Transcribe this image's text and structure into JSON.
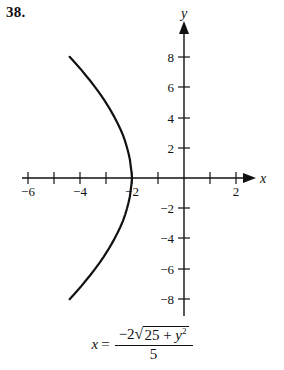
{
  "problem": {
    "number": "38."
  },
  "chart_data": {
    "type": "line",
    "title": "",
    "xlabel": "x",
    "ylabel": "y",
    "grid": false,
    "legend": null,
    "xlim": [
      -6.8,
      2.9
    ],
    "ylim": [
      -9.0,
      9.0
    ],
    "xticks": [
      -6,
      -5,
      -4,
      -3,
      -2,
      -1,
      1,
      2
    ],
    "yticks": [
      -8,
      -6,
      -4,
      -2,
      2,
      4,
      6,
      8
    ],
    "xtick_labels": [
      "−6",
      "−4",
      "−2",
      "2"
    ],
    "xtick_label_values": [
      -6,
      -4,
      -2,
      2
    ],
    "ytick_labels": [
      "8",
      "6",
      "4",
      "2",
      "−2",
      "−4",
      "−6",
      "−8"
    ],
    "ytick_label_values": [
      8,
      6,
      4,
      2,
      -2,
      -4,
      -6,
      -8
    ],
    "equation": "x = -2*sqrt(25 + y^2)/5",
    "curve_description": "left branch of a hyperbola opening leftward, vertex at (-2, 0)",
    "vertex": [
      -2,
      0
    ],
    "series": [
      {
        "name": "x = -2√(25 + y²)/5",
        "x": [
          -4.4,
          -4.19,
          -3.98,
          -3.79,
          -3.6,
          -3.42,
          -3.25,
          -3.09,
          -2.94,
          -2.8,
          -2.67,
          -2.55,
          -2.44,
          -2.34,
          -2.26,
          -2.19,
          -2.13,
          -2.08,
          -2.05,
          -2.02,
          -2.0,
          -2.02,
          -2.05,
          -2.08,
          -2.13,
          -2.19,
          -2.26,
          -2.34,
          -2.44,
          -2.55,
          -2.67,
          -2.8,
          -2.94,
          -3.09,
          -3.25,
          -3.42,
          -3.6,
          -3.79,
          -3.98,
          -4.19,
          -4.4
        ],
        "y": [
          8.0,
          7.6,
          7.2,
          6.8,
          6.4,
          6.0,
          5.6,
          5.2,
          4.8,
          4.4,
          4.0,
          3.6,
          3.2,
          2.8,
          2.4,
          2.0,
          1.6,
          1.2,
          0.8,
          0.4,
          0.0,
          -0.4,
          -0.8,
          -1.2,
          -1.6,
          -2.0,
          -2.4,
          -2.8,
          -3.2,
          -3.6,
          -4.0,
          -4.4,
          -4.8,
          -5.2,
          -5.6,
          -6.0,
          -6.4,
          -6.8,
          -7.2,
          -7.6,
          -8.0
        ]
      }
    ],
    "color": "#111111"
  },
  "equation_display": {
    "lhs": "x",
    "equals": "=",
    "numerator_prefix": "−2",
    "radical_symbol": "√",
    "radicand_base": "25 + ",
    "radicand_var": "y",
    "radicand_exponent": "2",
    "denominator": "5"
  }
}
